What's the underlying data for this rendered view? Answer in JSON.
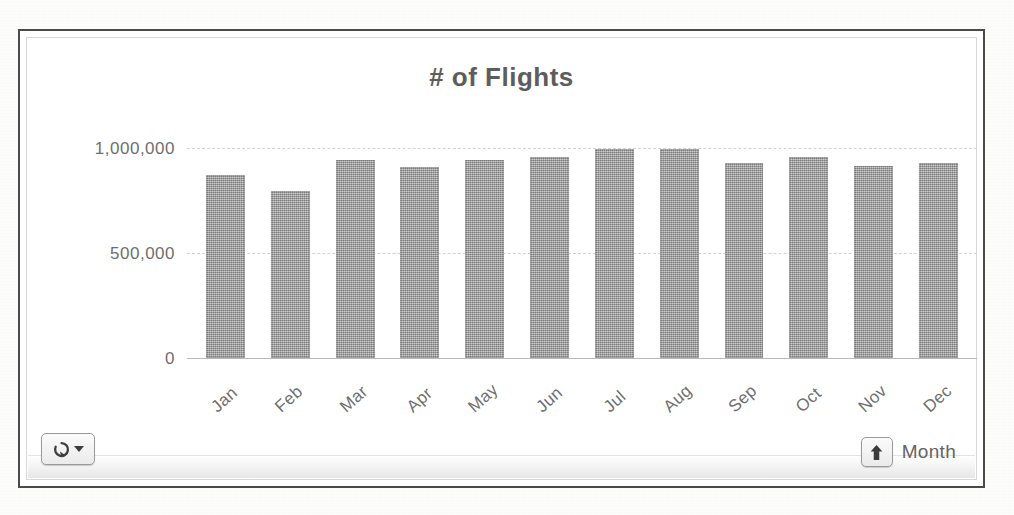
{
  "chart": {
    "title": "# of Flights",
    "field_button_label": "Month",
    "drill_icon": "rotate-refresh-icon",
    "drill_caret_icon": "chevron-down-icon",
    "drill_up_icon": "arrow-up-icon"
  },
  "chart_data": {
    "type": "bar",
    "title": "# of Flights",
    "xlabel": "Month",
    "ylabel": "",
    "categories": [
      "Jan",
      "Feb",
      "Mar",
      "Apr",
      "May",
      "Jun",
      "Jul",
      "Aug",
      "Sep",
      "Oct",
      "Nov",
      "Dec"
    ],
    "values": [
      870000,
      795000,
      945000,
      910000,
      945000,
      955000,
      995000,
      995000,
      930000,
      955000,
      915000,
      930000
    ],
    "ytick_labels": [
      "0",
      "500,000",
      "1,000,000"
    ],
    "ytick_values": [
      0,
      500000,
      1000000
    ],
    "ylim": [
      0,
      1000000
    ],
    "grid": true,
    "legend": false,
    "series_color": "#949494"
  }
}
